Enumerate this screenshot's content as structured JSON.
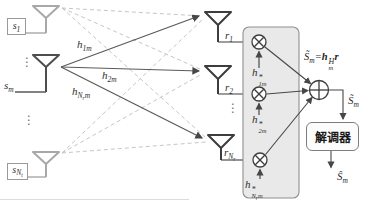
{
  "diagram": {
    "tx": {
      "s1": {
        "base": "s",
        "sub": "1"
      },
      "sm": {
        "base": "s",
        "sub": "m"
      },
      "snt": {
        "base": "s",
        "sub": "N",
        "subsub": "t"
      }
    },
    "channels": {
      "h1m": {
        "base": "h",
        "sub": "1m"
      },
      "h2m": {
        "base": "h",
        "sub": "2m"
      },
      "hnrm": {
        "base": "h",
        "sub": "N",
        "subsub": "r",
        "subtail": "m"
      }
    },
    "rx": {
      "r1": {
        "base": "r",
        "sub": "1"
      },
      "r2": {
        "base": "r",
        "sub": "2"
      },
      "rnr": {
        "base": "r",
        "sub": "N",
        "subsub": "r"
      }
    },
    "weights": {
      "w1": {
        "base": "h",
        "sup": "*",
        "sub": "1m"
      },
      "w2": {
        "base": "h",
        "sup": "*",
        "sub": "2m"
      },
      "w3": {
        "base": "h",
        "sup": "*",
        "sub": "N",
        "subsub": "r",
        "subtail": "m"
      }
    },
    "combiner": {
      "formula": {
        "lhs": "S̃",
        "lhs_sub": "m",
        "eq": "=",
        "h": "h",
        "h_sup": "H",
        "h_sub": "m",
        "r": "r"
      },
      "output": {
        "base": "S̃",
        "sub": "m"
      }
    },
    "demodulator": {
      "label": "解调器",
      "output": {
        "base": "Ŝ",
        "sub": "m"
      }
    },
    "dots": "⋮",
    "colors": {
      "inactive_gray": "#a8a8a8",
      "active_dark": "#4d4d4d",
      "dashed_path": "#c6c6c6",
      "combiner_box_fill": "#e9e9e9",
      "combiner_box_border": "#909090"
    }
  }
}
